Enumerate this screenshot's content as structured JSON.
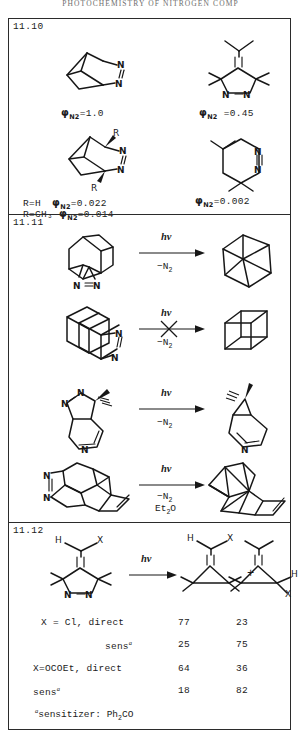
{
  "running_head": "PHOTOCHEMISTRY  OF  NITROGEN  COMP",
  "panels": [
    {
      "id": "11.10",
      "number": "11.10",
      "entries": [
        {
          "label_prefix": "",
          "phi": "φ",
          "phi_sub": "N2",
          "value": "=1.0",
          "structure": "2,3-diazabicyclo[2.2.1]hept-2-ene"
        },
        {
          "label_prefix": "",
          "phi": "φ",
          "phi_sub": "N2",
          "value": " =0.45",
          "structure": "tetramethyl-isopropylidene-pyrazoline"
        },
        {
          "label_prefix": "R=H",
          "phi": "φ",
          "phi_sub": "N2",
          "value": "=0.022",
          "structure": "bridgehead-R-diazabicycloheptene"
        },
        {
          "label_prefix": "R=CH₃",
          "phi": "φ",
          "phi_sub": "N2",
          "value": "=0.014",
          "structure": "bridgehead-R-diazabicycloheptene"
        },
        {
          "label_prefix": "",
          "phi": "φ",
          "phi_sub": "N2",
          "value": "=0.002",
          "structure": "tetramethyl-tetrahydropyridazine"
        }
      ],
      "substituent_labels": {
        "R_top": "R",
        "R_bottom": "R"
      },
      "atom_labels": [
        "N",
        "N"
      ]
    },
    {
      "id": "11.11",
      "number": "11.11",
      "reactions": [
        {
          "name": "azo-to-prismane",
          "conditions": {
            "line1": "hν",
            "line2": "−N",
            "line2_sub": "2",
            "line3": ""
          },
          "blocked": false,
          "reactant_atoms": [
            "N",
            "N"
          ],
          "product_atoms": []
        },
        {
          "name": "azo-cubane-blocked",
          "conditions": {
            "line1": "hν",
            "line2": "−N",
            "line2_sub": "2",
            "line3": ""
          },
          "blocked": true,
          "reactant_atoms": [
            "N",
            "N"
          ],
          "product_atoms": []
        },
        {
          "name": "pyrazolo-pyridine-to-cyclopropane",
          "conditions": {
            "line1": "hν",
            "line2": "−N",
            "line2_sub": "2",
            "line3": ""
          },
          "blocked": false,
          "reactant_atoms": [
            "N",
            "N",
            "N"
          ],
          "product_atoms": [
            "N"
          ]
        },
        {
          "name": "polycyclic-azo-to-cage",
          "conditions": {
            "line1": "hν",
            "line2": "−N",
            "line2_sub": "2",
            "line3": "Et",
            "line3_sub": "2",
            "line3_end": "O"
          },
          "blocked": false,
          "reactant_atoms": [
            "N",
            "N"
          ],
          "product_atoms": []
        }
      ]
    },
    {
      "id": "11.12",
      "number": "11.12",
      "scheme": {
        "conditions": {
          "line1": "hν"
        },
        "plus": "+",
        "reactant_atoms": {
          "H": "H",
          "X": "X",
          "N1": "N",
          "N2": "N"
        },
        "product1_atoms": {
          "H": "H",
          "X": "X"
        },
        "product2_atoms": {
          "H": "H",
          "X": "X"
        }
      },
      "table": {
        "rows": [
          {
            "label": "X = Cl, direct",
            "label_sup": "",
            "col1": "77",
            "col2": "23"
          },
          {
            "label": "sens",
            "label_sup": "a",
            "col1": "25",
            "col2": "75"
          },
          {
            "label": "X=OCOEt, direct",
            "label_sup": "",
            "col1": "64",
            "col2": "36"
          },
          {
            "label": "sens",
            "label_sup": "a",
            "col1": "18",
            "col2": "82"
          }
        ],
        "footnote": {
          "sup": "a",
          "text": "sensitizer: Ph",
          "sub": "2",
          "text_end": "CO"
        }
      }
    }
  ]
}
